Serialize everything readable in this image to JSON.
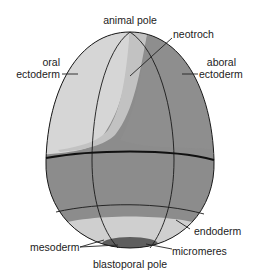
{
  "diagram": {
    "colors": {
      "oral_ectoderm": "#d4d4d4",
      "neotroch": "#c4c4c4",
      "aboral_ectoderm": "#8e8e8e",
      "endoderm": "#8a8a8a",
      "mesoderm": "#cfcfcf",
      "micromeres": "#5e5e5e",
      "outline": "#1a1a1a",
      "background": "#ffffff"
    },
    "labels": {
      "animal_pole": "animal pole",
      "neotroch": "neotroch",
      "oral_ectoderm": "oral\nectoderm",
      "oral_line1": "oral",
      "oral_line2": "ectoderm",
      "aboral_line1": "aboral",
      "aboral_line2": "ectoderm",
      "endoderm": "endoderm",
      "mesoderm": "mesoderm",
      "micromeres": "micromeres",
      "blastoporal_pole": "blastoporal pole"
    }
  }
}
